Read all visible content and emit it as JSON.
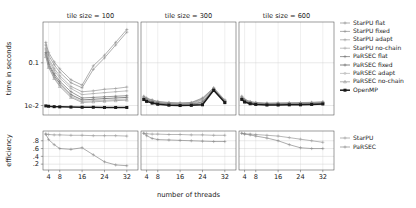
{
  "chart_data": {
    "type": "line",
    "title": "",
    "facets": [
      {
        "label": "tile size = 100"
      },
      {
        "label": "tile size = 300"
      },
      {
        "label": "tile size = 600"
      }
    ],
    "xlabel": "number of threads",
    "xticks": [
      4,
      8,
      16,
      24,
      32
    ],
    "xlim": [
      2,
      36
    ],
    "top_panel": {
      "ylabel": "time in seconds",
      "yticks_labels": [
        "0.1",
        "1e-2"
      ],
      "yticks_values": [
        0.1,
        0.01
      ],
      "ylim": [
        0.006,
        0.9
      ],
      "yscale": "log",
      "grid": true
    },
    "bottom_panel": {
      "ylabel": "efficiency",
      "yticks_labels": [
        ".8",
        ".6",
        ".4",
        ".2"
      ],
      "yticks_values": [
        0.8,
        0.6,
        0.4,
        0.2
      ],
      "ylim": [
        0.05,
        1.05
      ],
      "yscale": "linear",
      "grid": true
    },
    "legend_top": [
      {
        "name": "StarPU flat",
        "color": "#8c8c8c",
        "marker": "plus",
        "width": 0.7
      },
      {
        "name": "StarPU fixed",
        "color": "#8c8c8c",
        "marker": "plus",
        "width": 0.7
      },
      {
        "name": "StarPU adapt",
        "color": "#9a9a9a",
        "marker": "plus",
        "width": 0.7
      },
      {
        "name": "StarPU no-chain",
        "color": "#a5a5a5",
        "marker": "plus",
        "width": 0.7
      },
      {
        "name": "PaRSEC flat",
        "color": "#707070",
        "marker": "plus",
        "width": 0.7
      },
      {
        "name": "PaRSEC fixed",
        "color": "#6a6a6a",
        "marker": "plus",
        "width": 0.8
      },
      {
        "name": "PaRSEC adapt",
        "color": "#b0b0b0",
        "marker": "dot",
        "width": 0.7
      },
      {
        "name": "PaRSEC no-chain",
        "color": "#8f8f8f",
        "marker": "tri",
        "width": 0.7
      },
      {
        "name": "OpenMP",
        "color": "#1a1a1a",
        "marker": "square",
        "width": 1.5
      }
    ],
    "legend_bottom": [
      {
        "name": "StarPU",
        "color": "#9a9a9a",
        "marker": "plus",
        "width": 0.7
      },
      {
        "name": "PaRSEC",
        "color": "#8a8a8a",
        "marker": "plus",
        "width": 0.7
      }
    ],
    "x": [
      3,
      4,
      6,
      8,
      12,
      16,
      20,
      24,
      28,
      32
    ],
    "time_series": [
      {
        "facet": 0,
        "name": "StarPU flat",
        "values": [
          0.3,
          0.175,
          0.105,
          0.072,
          0.04,
          0.03,
          0.085,
          0.15,
          0.3,
          0.6
        ]
      },
      {
        "facet": 0,
        "name": "StarPU fixed",
        "values": [
          0.26,
          0.15,
          0.09,
          0.06,
          0.034,
          0.026,
          0.07,
          0.13,
          0.26,
          0.52
        ]
      },
      {
        "facet": 0,
        "name": "StarPU adapt",
        "values": [
          0.22,
          0.125,
          0.074,
          0.05,
          0.028,
          0.021,
          0.022,
          0.024,
          0.025,
          0.027
        ]
      },
      {
        "facet": 0,
        "name": "StarPU no-chain",
        "values": [
          0.2,
          0.112,
          0.066,
          0.044,
          0.025,
          0.018,
          0.019,
          0.02,
          0.021,
          0.022
        ]
      },
      {
        "facet": 0,
        "name": "PaRSEC flat",
        "values": [
          0.175,
          0.098,
          0.056,
          0.037,
          0.021,
          0.015,
          0.0155,
          0.016,
          0.0165,
          0.017
        ]
      },
      {
        "facet": 0,
        "name": "PaRSEC fixed",
        "values": [
          0.16,
          0.09,
          0.05,
          0.033,
          0.018,
          0.0135,
          0.014,
          0.0145,
          0.015,
          0.0155
        ]
      },
      {
        "facet": 0,
        "name": "PaRSEC adapt",
        "values": [
          0.15,
          0.082,
          0.046,
          0.03,
          0.0165,
          0.0125,
          0.013,
          0.0133,
          0.0138,
          0.0142
        ]
      },
      {
        "facet": 0,
        "name": "PaRSEC no-chain",
        "values": [
          0.14,
          0.078,
          0.043,
          0.028,
          0.0155,
          0.0118,
          0.0122,
          0.0126,
          0.013,
          0.0134
        ]
      },
      {
        "facet": 0,
        "name": "OpenMP",
        "values": [
          0.0098,
          0.0096,
          0.0094,
          0.0093,
          0.0092,
          0.0091,
          0.0091,
          0.009,
          0.009,
          0.009
        ]
      },
      {
        "facet": 1,
        "name": "StarPU flat",
        "values": [
          0.0165,
          0.015,
          0.0135,
          0.0125,
          0.0118,
          0.0115,
          0.0118,
          0.015,
          0.026,
          0.0135
        ]
      },
      {
        "facet": 1,
        "name": "StarPU fixed",
        "values": [
          0.016,
          0.0146,
          0.0132,
          0.0122,
          0.0115,
          0.0113,
          0.0116,
          0.0145,
          0.0255,
          0.0132
        ]
      },
      {
        "facet": 1,
        "name": "StarPU adapt",
        "values": [
          0.0155,
          0.0142,
          0.0129,
          0.0119,
          0.0113,
          0.0111,
          0.0113,
          0.0138,
          0.025,
          0.0129
        ]
      },
      {
        "facet": 1,
        "name": "StarPU no-chain",
        "values": [
          0.0152,
          0.0139,
          0.0126,
          0.0117,
          0.0111,
          0.0109,
          0.0111,
          0.0132,
          0.0245,
          0.0127
        ]
      },
      {
        "facet": 1,
        "name": "PaRSEC flat",
        "values": [
          0.0148,
          0.0135,
          0.0123,
          0.0114,
          0.0108,
          0.0106,
          0.0108,
          0.0122,
          0.024,
          0.0124
        ]
      },
      {
        "facet": 1,
        "name": "PaRSEC fixed",
        "values": [
          0.0145,
          0.0132,
          0.012,
          0.0112,
          0.0106,
          0.0104,
          0.0106,
          0.0116,
          0.0236,
          0.0122
        ]
      },
      {
        "facet": 1,
        "name": "PaRSEC adapt",
        "values": [
          0.0143,
          0.013,
          0.0118,
          0.011,
          0.0105,
          0.0103,
          0.0104,
          0.0112,
          0.0233,
          0.012
        ]
      },
      {
        "facet": 1,
        "name": "PaRSEC no-chain",
        "values": [
          0.0141,
          0.0128,
          0.0116,
          0.0109,
          0.0104,
          0.0102,
          0.0103,
          0.0108,
          0.023,
          0.0119
        ]
      },
      {
        "facet": 1,
        "name": "OpenMP",
        "values": [
          0.0138,
          0.0125,
          0.0114,
          0.0107,
          0.0102,
          0.01,
          0.0101,
          0.0104,
          0.0228,
          0.0117
        ]
      },
      {
        "facet": 2,
        "name": "StarPU flat",
        "values": [
          0.0165,
          0.014,
          0.0124,
          0.0118,
          0.0114,
          0.0115,
          0.0116,
          0.0117,
          0.0119,
          0.0122
        ]
      },
      {
        "facet": 2,
        "name": "StarPU fixed",
        "values": [
          0.016,
          0.0137,
          0.0122,
          0.0116,
          0.0112,
          0.0113,
          0.0114,
          0.0115,
          0.0117,
          0.012
        ]
      },
      {
        "facet": 2,
        "name": "StarPU adapt",
        "values": [
          0.0156,
          0.0134,
          0.012,
          0.0114,
          0.011,
          0.0111,
          0.0112,
          0.0113,
          0.0115,
          0.0118
        ]
      },
      {
        "facet": 2,
        "name": "StarPU no-chain",
        "values": [
          0.0152,
          0.0131,
          0.0118,
          0.0112,
          0.0109,
          0.0109,
          0.011,
          0.0111,
          0.0113,
          0.0116
        ]
      },
      {
        "facet": 2,
        "name": "PaRSEC flat",
        "values": [
          0.0148,
          0.0128,
          0.0116,
          0.0111,
          0.0107,
          0.0108,
          0.0108,
          0.0109,
          0.0111,
          0.0114
        ]
      },
      {
        "facet": 2,
        "name": "PaRSEC fixed",
        "values": [
          0.0145,
          0.0126,
          0.0114,
          0.0109,
          0.0106,
          0.0106,
          0.0107,
          0.0108,
          0.0109,
          0.0112
        ]
      },
      {
        "facet": 2,
        "name": "PaRSEC adapt",
        "values": [
          0.0143,
          0.0124,
          0.0113,
          0.0108,
          0.0105,
          0.0105,
          0.0106,
          0.0106,
          0.0108,
          0.0111
        ]
      },
      {
        "facet": 2,
        "name": "PaRSEC no-chain",
        "values": [
          0.0141,
          0.0122,
          0.0112,
          0.0107,
          0.0104,
          0.0104,
          0.0105,
          0.0105,
          0.0107,
          0.011
        ]
      },
      {
        "facet": 2,
        "name": "OpenMP",
        "values": [
          0.0139,
          0.0121,
          0.011,
          0.0106,
          0.0103,
          0.0103,
          0.0104,
          0.0104,
          0.0106,
          0.0109
        ]
      }
    ],
    "efficiency_series": [
      {
        "facet": 0,
        "name": "StarPU",
        "values": [
          0.97,
          0.96,
          0.95,
          0.95,
          0.94,
          0.94,
          0.93,
          0.93,
          0.93,
          0.92
        ]
      },
      {
        "facet": 0,
        "name": "PaRSEC",
        "values": [
          0.97,
          0.83,
          0.7,
          0.6,
          0.58,
          0.62,
          0.44,
          0.26,
          0.18,
          0.16
        ]
      },
      {
        "facet": 1,
        "name": "StarPU",
        "values": [
          0.99,
          0.98,
          0.97,
          0.97,
          0.96,
          0.96,
          0.95,
          0.95,
          0.94,
          0.94
        ]
      },
      {
        "facet": 1,
        "name": "PaRSEC",
        "values": [
          0.99,
          0.93,
          0.86,
          0.83,
          0.82,
          0.81,
          0.8,
          0.79,
          0.78,
          0.78
        ]
      },
      {
        "facet": 2,
        "name": "StarPU",
        "values": [
          0.99,
          0.98,
          0.97,
          0.96,
          0.94,
          0.92,
          0.88,
          0.84,
          0.8,
          0.76
        ]
      },
      {
        "facet": 2,
        "name": "PaRSEC",
        "values": [
          0.99,
          0.97,
          0.95,
          0.92,
          0.87,
          0.8,
          0.7,
          0.62,
          0.6,
          0.6
        ]
      }
    ]
  },
  "axes": {
    "top_ylabel": "time in seconds",
    "bottom_ylabel": "efficiency",
    "xlabel": "number of threads"
  }
}
